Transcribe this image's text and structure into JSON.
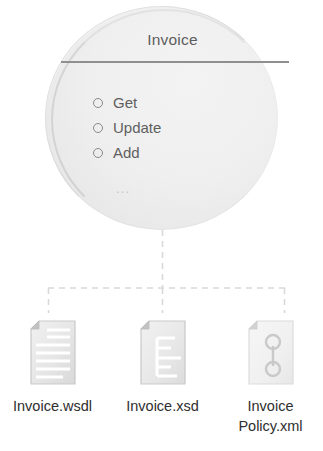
{
  "diagram": {
    "service": {
      "title": "Invoice",
      "operations": [
        {
          "label": "Get"
        },
        {
          "label": "Update"
        },
        {
          "label": "Add"
        }
      ],
      "more_indicator": "…"
    },
    "artifacts": [
      {
        "id": "wsdl",
        "icon": "document-lines-icon",
        "label": "Invoice.wsdl"
      },
      {
        "id": "xsd",
        "icon": "document-tree-icon",
        "label": "Invoice.xsd"
      },
      {
        "id": "policy",
        "icon": "document-policy-icon",
        "label_line1": "Invoice",
        "label_line2": "Policy.xml"
      }
    ],
    "connector": {
      "style": "dashed",
      "color": "#d8d8d8"
    },
    "colors": {
      "circle_fill": "#efefef",
      "circle_edge": "#a8a8a8",
      "divider": "#8f8f8f",
      "title_text": "#5d5d5d",
      "operation_text": "#5f5f5f",
      "label_text": "#2e2e2e",
      "icon_body": "#eaeaea",
      "icon_edge": "#cfcfcf",
      "icon_shade": "#bdbdbd"
    }
  }
}
